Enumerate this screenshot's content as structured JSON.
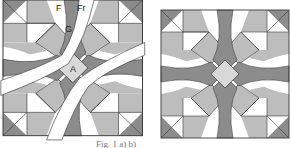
{
  "figure": {
    "left_panel": {
      "description": "quilt block pattern separated into pieces by cut lines",
      "labels": [
        {
          "id": "F",
          "text": "F"
        },
        {
          "id": "Fr",
          "text": "Fr"
        },
        {
          "id": "G",
          "text": "G"
        },
        {
          "id": "A",
          "text": "A"
        }
      ]
    },
    "right_panel": {
      "description": "assembled symmetric quilt block"
    },
    "caption": "Fig. 1  a)  b)"
  },
  "colors": {
    "dark": "#8c8c8c",
    "medium": "#bdbdbd",
    "light": "#d8d8d8",
    "white": "#ffffff",
    "line": "#3a3a3a"
  }
}
